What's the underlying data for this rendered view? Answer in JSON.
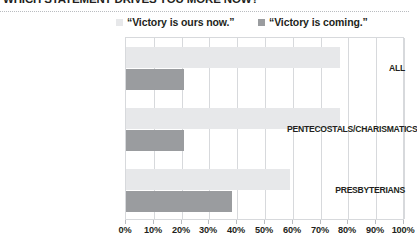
{
  "header": {
    "title": "WHICH STATEMENT DRIVES YOU MORE NOW?"
  },
  "legend": {
    "position": "top",
    "items": [
      {
        "label": "“Victory is ours now.”",
        "color": "#e7e8ea"
      },
      {
        "label": "“Victory is coming.”",
        "color": "#9a9c9f"
      }
    ]
  },
  "axis": {
    "tick_labels": [
      "0%",
      "10%",
      "20%",
      "30%",
      "40%",
      "50%",
      "60%",
      "70%",
      "80%",
      "90%",
      "100%"
    ],
    "min": 0,
    "max": 100
  },
  "categories": [
    "ALL",
    "PENTECOSTALS/CHARISMATICS",
    "PRESBYTERIANS"
  ],
  "colors": {
    "series_victory_ours_now": "#e7e8ea",
    "series_victory_is_coming": "#9a9c9f",
    "grid": "#d7d9dc",
    "frame": "#d7d9dc",
    "text": "#231f20"
  },
  "chart_data": {
    "type": "bar",
    "orientation": "horizontal",
    "title": "WHICH STATEMENT DRIVES YOU MORE NOW?",
    "xlabel": "",
    "ylabel": "",
    "xlim": [
      0,
      100
    ],
    "xticks": [
      0,
      10,
      20,
      30,
      40,
      50,
      60,
      70,
      80,
      90,
      100
    ],
    "xtick_labels": [
      "0%",
      "10%",
      "20%",
      "30%",
      "40%",
      "50%",
      "60%",
      "70%",
      "80%",
      "90%",
      "100%"
    ],
    "grid": true,
    "legend_position": "top",
    "categories": [
      "ALL",
      "PENTECOSTALS/CHARISMATICS",
      "PRESBYTERIANS"
    ],
    "series": [
      {
        "name": "“Victory is ours now.”",
        "color": "#e7e8ea",
        "values": [
          77,
          77,
          59
        ]
      },
      {
        "name": "“Victory is coming.”",
        "color": "#9a9c9f",
        "values": [
          21,
          21,
          38
        ]
      }
    ]
  }
}
